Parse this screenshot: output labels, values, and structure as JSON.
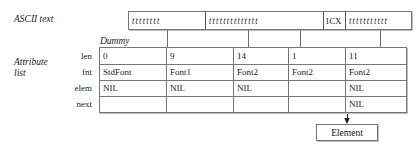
{
  "figure": {
    "labels": {
      "ascii_text": "ASCII text",
      "attribute_list_line1": "Attribute",
      "attribute_list_line2": "list",
      "dummy": "Dummy"
    },
    "row_labels": {
      "len": "len",
      "fnt": "fnt",
      "elem": "elem",
      "next": "next"
    },
    "ascii_bar": {
      "segments": [
        {
          "kind": "squiggle",
          "text": "tttttttt",
          "width_px": 76
        },
        {
          "kind": "squiggle",
          "text": "tttttttttttttt",
          "width_px": 118
        },
        {
          "kind": "code",
          "text": "1CX",
          "width_px": 22
        },
        {
          "kind": "squiggle",
          "text": "ttttttttttt",
          "width_px": 66
        }
      ]
    },
    "nodes": [
      {
        "name": "dummy-node",
        "len": "0",
        "fnt": "StdFont",
        "elem": "NIL",
        "next": "",
        "left_px": 99,
        "top_px": 47
      },
      {
        "name": "node-2",
        "len": "9",
        "fnt": "Font1",
        "elem": "NIL",
        "next": "",
        "left_px": 166,
        "top_px": 47
      },
      {
        "name": "node-3",
        "len": "14",
        "fnt": "Font2",
        "elem": "NIL",
        "next": "",
        "left_px": 233,
        "top_px": 47
      },
      {
        "name": "node-4",
        "len": "1",
        "fnt": "Font2",
        "elem": "",
        "next": "",
        "left_px": 288,
        "top_px": 47
      },
      {
        "name": "node-5",
        "len": "11",
        "fnt": "Font2",
        "elem": "NIL",
        "next": "NIL",
        "left_px": 345,
        "top_px": 47
      }
    ],
    "element_box": {
      "label": "Element"
    },
    "colors": {
      "box_border": "#777777",
      "box_shadow": "#bdbdbd",
      "arrow": "#1a1a1a",
      "text": "#1a1a1a",
      "background": "#ffffff"
    }
  }
}
